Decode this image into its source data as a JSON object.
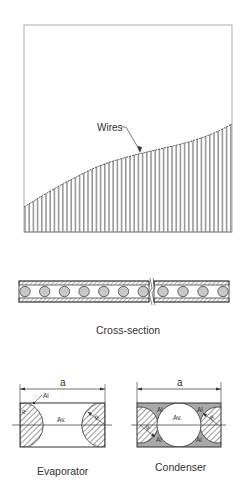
{
  "figure": {
    "top_panel": {
      "title": "Wire fill profile",
      "annotation": {
        "label": "Wires",
        "x": 97,
        "y": 131,
        "leader_from": [
          113,
          127
        ],
        "leader_to": [
          140,
          152
        ]
      },
      "box": {
        "x1": 24,
        "y1": 25,
        "x2": 232,
        "y2": 232
      },
      "curve": [
        [
          24,
          207
        ],
        [
          45,
          194
        ],
        [
          70,
          180
        ],
        [
          100,
          165
        ],
        [
          130,
          156
        ],
        [
          160,
          149
        ],
        [
          190,
          142
        ],
        [
          215,
          133
        ],
        [
          232,
          124
        ]
      ],
      "wire_spacing": 4.2,
      "colors": {
        "stroke": "#555555",
        "fill": "#9a9a9a",
        "box": "#888888"
      }
    },
    "cross_section": {
      "caption": "Cross-section",
      "strip": {
        "x1": 19,
        "x2": 229,
        "y_top": 281,
        "y_bot": 302,
        "break_x": 152
      },
      "wire_count_left": 7,
      "wire_count_right": 4
    },
    "evaporator": {
      "caption": "Evaporator",
      "dimension_label": "a",
      "labels": {
        "material": "Al",
        "vapor": "Av.",
        "radius_left": "R",
        "radius_right": "R"
      },
      "box": {
        "x1": 20,
        "y1": 403,
        "x2": 105,
        "y2": 447
      }
    },
    "condenser": {
      "caption": "Condenser",
      "dimension_label": "a",
      "labels": {
        "material_tl": "Al",
        "material_tr": "Al",
        "material_bl": "Al",
        "material_br": "Al",
        "vapor": "Av.",
        "radius_left": "R",
        "radius_right": "R"
      },
      "box": {
        "x1": 137,
        "y1": 403,
        "x2": 221,
        "y2": 447
      },
      "colors": {
        "fill": "#a9a9a9"
      }
    }
  }
}
